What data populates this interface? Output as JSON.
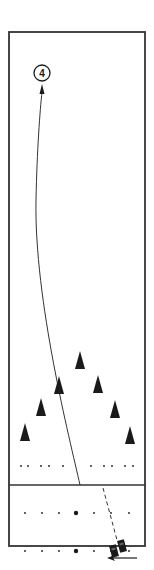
{
  "diagram": {
    "kind": "drill-diagram",
    "colors": {
      "ink": "#1a1a1a",
      "line": "#333333",
      "background": "#ffffff"
    },
    "player_marker": {
      "label": "4",
      "icon": "numbered-circle"
    },
    "cones": {
      "count": 7,
      "icon": "cone-triangle",
      "arrangement": "inverted-V"
    },
    "vehicles": {
      "count": 2,
      "icon": "car-block"
    },
    "direction_arrow": {
      "icon": "left-arrow",
      "direction": "left"
    },
    "paths": [
      {
        "name": "run-path",
        "style": "solid",
        "ends_with": "arrowhead",
        "target": "player-4"
      },
      {
        "name": "approach-path",
        "style": "dashed"
      }
    ]
  }
}
